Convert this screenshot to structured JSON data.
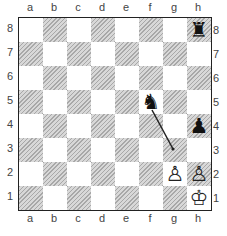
{
  "files": [
    "a",
    "b",
    "c",
    "d",
    "e",
    "f",
    "g",
    "h"
  ],
  "ranks": [
    "8",
    "7",
    "6",
    "5",
    "4",
    "3",
    "2",
    "1"
  ],
  "pieces": [
    {
      "square": "h8",
      "type": "rook",
      "color": "black",
      "glyph": "♜"
    },
    {
      "square": "f5",
      "type": "knight",
      "color": "black",
      "glyph": "♞"
    },
    {
      "square": "h4",
      "type": "pawn",
      "color": "black",
      "glyph": "♟"
    },
    {
      "square": "g2",
      "type": "pawn",
      "color": "white",
      "glyph": "♙"
    },
    {
      "square": "h2",
      "type": "pawn",
      "color": "white",
      "glyph": "♙"
    },
    {
      "square": "h1",
      "type": "king",
      "color": "white",
      "glyph": "♔"
    }
  ],
  "arrow": {
    "from": "f5",
    "to": "g3",
    "color": "#222222"
  },
  "colors": {
    "light_square": "#ffffff",
    "dark_square": "#d8d8d8",
    "border": "#222222"
  }
}
